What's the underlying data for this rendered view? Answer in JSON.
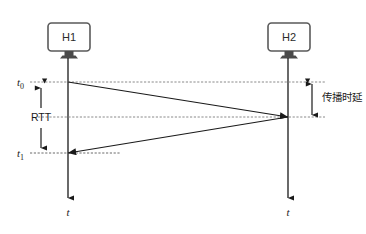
{
  "diagram": {
    "hosts": [
      {
        "id": "h1",
        "label": "H1",
        "timeline_x": 68
      },
      {
        "id": "h2",
        "label": "H2",
        "timeline_x": 288
      }
    ],
    "time_axis_label": "t",
    "markers": [
      {
        "id": "t0",
        "base": "t",
        "sub": "0",
        "y": 82
      },
      {
        "id": "t1",
        "base": "t",
        "sub": "1",
        "y": 153
      }
    ],
    "annotations": {
      "rtt": "RTT",
      "propagation_delay": "传播时延"
    },
    "messages": [
      {
        "id": "request",
        "from": "h1",
        "to": "h2",
        "start_y": 82,
        "end_y": 117
      },
      {
        "id": "reply",
        "from": "h2",
        "to": "h1",
        "start_y": 117,
        "end_y": 153
      }
    ],
    "colors": {
      "line": "#1a1a1a",
      "dotted": "#808080",
      "monitor_stroke": "#5a5a5a",
      "background": "#ffffff"
    }
  }
}
